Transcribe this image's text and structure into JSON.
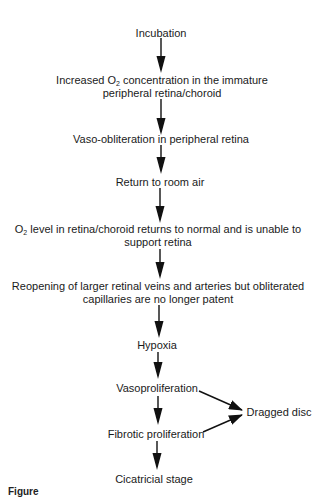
{
  "diagram": {
    "type": "flowchart",
    "nodes": [
      {
        "id": "incubation",
        "lines": [
          "Incubation"
        ]
      },
      {
        "id": "increased-o2",
        "lines": [
          "Increased O",
          "2",
          " concentration in the immature",
          "peripheral retina/choroid"
        ]
      },
      {
        "id": "vaso-obliteration",
        "lines": [
          "Vaso-obliteration in peripheral retina"
        ]
      },
      {
        "id": "return-room-air",
        "lines": [
          "Return to room air"
        ]
      },
      {
        "id": "o2-level",
        "lines": [
          "O",
          "2",
          " level in retina/choroid returns to normal and is unable to",
          "support retina"
        ]
      },
      {
        "id": "reopening",
        "lines": [
          "Reopening of larger retinal veins and arteries but obliterated",
          "capillaries are no longer patent"
        ]
      },
      {
        "id": "hypoxia",
        "lines": [
          "Hypoxia"
        ]
      },
      {
        "id": "vasoproliferation",
        "lines": [
          "Vasoproliferation"
        ]
      },
      {
        "id": "fibrotic-proliferation",
        "lines": [
          "Fibrotic proliferation"
        ]
      },
      {
        "id": "cicatricial-stage",
        "lines": [
          "Cicatricial stage"
        ]
      },
      {
        "id": "dragged-disc",
        "lines": [
          "Dragged disc"
        ]
      }
    ],
    "edges": [
      {
        "from": "incubation",
        "to": "increased-o2"
      },
      {
        "from": "increased-o2",
        "to": "vaso-obliteration"
      },
      {
        "from": "vaso-obliteration",
        "to": "return-room-air"
      },
      {
        "from": "return-room-air",
        "to": "o2-level"
      },
      {
        "from": "o2-level",
        "to": "reopening"
      },
      {
        "from": "reopening",
        "to": "hypoxia"
      },
      {
        "from": "hypoxia",
        "to": "vasoproliferation"
      },
      {
        "from": "vasoproliferation",
        "to": "fibrotic-proliferation"
      },
      {
        "from": "fibrotic-proliferation",
        "to": "cicatricial-stage"
      },
      {
        "from": "vasoproliferation",
        "to": "dragged-disc"
      },
      {
        "from": "fibrotic-proliferation",
        "to": "dragged-disc"
      }
    ],
    "caption_fragment": "Figure"
  },
  "text": {
    "incubation": "Incubation",
    "increased_o2_a": "Increased O",
    "increased_o2_sub": "2",
    "increased_o2_b": " concentration in the immature",
    "increased_o2_line2": "peripheral retina/choroid",
    "vaso_obliteration": "Vaso-obliteration in peripheral retina",
    "return_room_air": "Return to room air",
    "o2_level_a": "O",
    "o2_level_sub": "2",
    "o2_level_b": " level in retina/choroid returns to normal and is unable to",
    "o2_level_line2": "support retina",
    "reopening_line1": "Reopening of larger retinal veins and arteries but obliterated",
    "reopening_line2": "capillaries are no longer patent",
    "hypoxia": "Hypoxia",
    "vasoproliferation": "Vasoproliferation",
    "fibrotic_proliferation": "Fibrotic proliferation",
    "cicatricial_stage": "Cicatricial stage",
    "dragged_disc": "Dragged disc",
    "caption": "Figure"
  },
  "colors": {
    "ink": "#1a1a1a",
    "background": "#ffffff"
  }
}
